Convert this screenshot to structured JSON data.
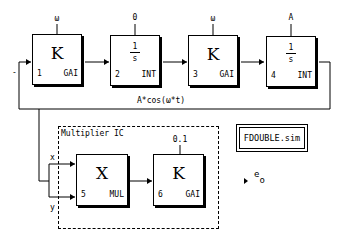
{
  "diagram": {
    "title_box": "FDOUBLE.sim",
    "feedback_sign": "-",
    "signal_label": "A*cos(ω*t)",
    "blocks": [
      {
        "index": "1",
        "type": "GAI",
        "symbol": "K",
        "param": "ω"
      },
      {
        "index": "2",
        "type": "INT",
        "symbol_num": "1",
        "symbol_den": "s",
        "param": "0"
      },
      {
        "index": "3",
        "type": "GAI",
        "symbol": "K",
        "param": "ω"
      },
      {
        "index": "4",
        "type": "INT",
        "symbol_num": "1",
        "symbol_den": "s",
        "param": "A"
      },
      {
        "index": "5",
        "type": "MUL",
        "symbol": "X",
        "param": ""
      },
      {
        "index": "6",
        "type": "GAI",
        "symbol": "K",
        "param": "0.1"
      }
    ],
    "multiplier_group": {
      "label": "Multiplier IC",
      "input_x": "x",
      "input_y": "y"
    },
    "output": {
      "label": "e",
      "subscript": "o"
    }
  }
}
